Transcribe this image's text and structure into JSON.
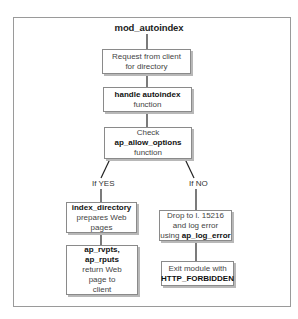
{
  "diagram": {
    "title": "mod_autoindex",
    "nodes": {
      "request": {
        "line1": "Request from client",
        "line2": "for directory"
      },
      "handle": {
        "bold": "handle autoindex",
        "line2": "function"
      },
      "check": {
        "line1": "Check",
        "bold": "ap_allow_options",
        "line3": "function"
      },
      "index_directory": {
        "bold": "index_directory",
        "line2": "prepares Web pages"
      },
      "rputs": {
        "bold1": "ap_rvpts,",
        "bold2": "ap_rputs",
        "line3": "return Web",
        "line4": "page to",
        "line5": "client"
      },
      "drop": {
        "line1": "Drop to l. 15216",
        "line2": "and log error",
        "line3_prefix": "using ",
        "line3_bold": "ap_log_error"
      },
      "exit": {
        "line1": "Exit module with",
        "bold": "HTTP_FORBIDDEN"
      }
    },
    "branches": {
      "yes": "If YES",
      "no": "If NO"
    },
    "colors": {
      "border": "#8a8a8a",
      "shadow": "#b8b8b8",
      "frame": "#9a9a9a",
      "line": "#222222"
    }
  }
}
